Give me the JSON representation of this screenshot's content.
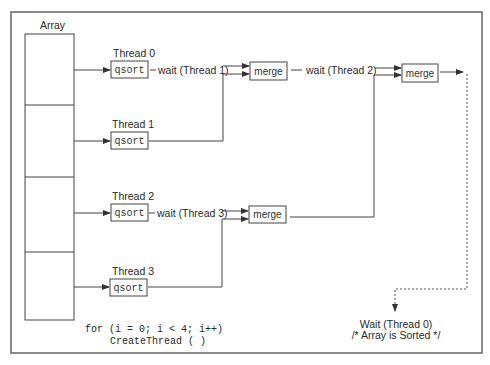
{
  "diagram": {
    "array_label": "Array",
    "threads": [
      {
        "label": "Thread 0",
        "op": "qsort",
        "wait_label": "wait (Thread 1)"
      },
      {
        "label": "Thread 1",
        "op": "qsort"
      },
      {
        "label": "Thread 2",
        "op": "qsort",
        "wait_label": "wait (Thread 3)"
      },
      {
        "label": "Thread 3",
        "op": "qsort"
      }
    ],
    "merges": [
      {
        "label": "merge",
        "wait_label": "wait (Thread 2)"
      },
      {
        "label": "merge"
      },
      {
        "label": "merge"
      }
    ],
    "loop_code": {
      "line1": "for (i = 0; i < 4; i++)",
      "line2": "CreateThread ( )"
    },
    "final": {
      "line1": "Wait (Thread 0)",
      "line2": "/* Array is Sorted */"
    },
    "colors": {
      "frame": "#6e6e6e",
      "stroke": "#444444",
      "background": "#ffffff"
    }
  }
}
